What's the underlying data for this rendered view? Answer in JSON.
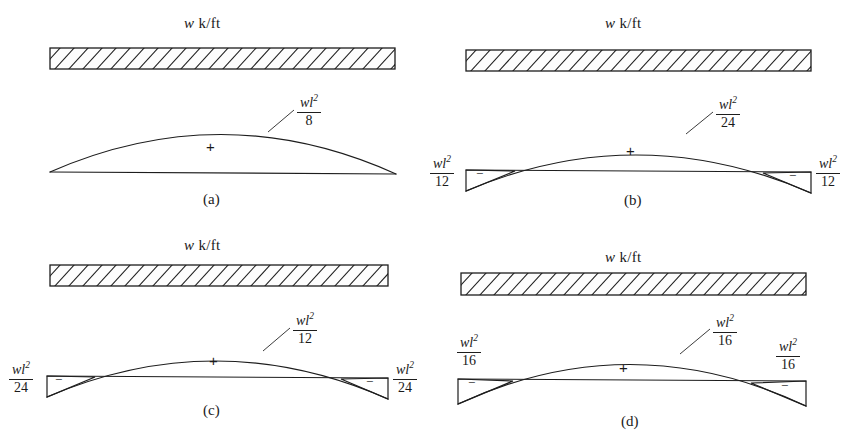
{
  "figure": {
    "type": "beam-bending-moment-diagrams",
    "background_color": "#ffffff",
    "line_color": "#1d1d1d",
    "panel_count": 4
  },
  "panels": [
    {
      "id": "a",
      "caption": "(a)",
      "load_label": {
        "symbol": "w",
        "unit": "k/ft"
      },
      "positive_sign": "+",
      "midspan_callout": {
        "numerator": "wl",
        "exponent": "2",
        "denominator": "8"
      },
      "supports": [],
      "has_end_moments": false
    },
    {
      "id": "b",
      "caption": "(b)",
      "load_label": {
        "symbol": "w",
        "unit": "k/ft"
      },
      "positive_sign": "+",
      "midspan_callout": {
        "numerator": "wl",
        "exponent": "2",
        "denominator": "24"
      },
      "supports": [
        {
          "side": "left",
          "sign": "−",
          "numerator": "wl",
          "exponent": "2",
          "denominator": "12"
        },
        {
          "side": "right",
          "sign": "−",
          "numerator": "wl",
          "exponent": "2",
          "denominator": "12"
        }
      ],
      "has_end_moments": true
    },
    {
      "id": "c",
      "caption": "(c)",
      "load_label": {
        "symbol": "w",
        "unit": "k/ft"
      },
      "positive_sign": "+",
      "midspan_callout": {
        "numerator": "wl",
        "exponent": "2",
        "denominator": "12"
      },
      "supports": [
        {
          "side": "left",
          "sign": "−",
          "numerator": "wl",
          "exponent": "2",
          "denominator": "24"
        },
        {
          "side": "right",
          "sign": "−",
          "numerator": "wl",
          "exponent": "2",
          "denominator": "24"
        }
      ],
      "has_end_moments": true
    },
    {
      "id": "d",
      "caption": "(d)",
      "load_label": {
        "symbol": "w",
        "unit": "k/ft"
      },
      "positive_sign": "+",
      "midspan_callout": {
        "numerator": "wl",
        "exponent": "2",
        "denominator": "16"
      },
      "supports": [
        {
          "side": "left",
          "sign": "−",
          "numerator": "wl",
          "exponent": "2",
          "denominator": "16"
        },
        {
          "side": "right",
          "sign": "−",
          "numerator": "wl",
          "exponent": "2",
          "denominator": "16"
        }
      ],
      "has_end_moments": true
    }
  ]
}
